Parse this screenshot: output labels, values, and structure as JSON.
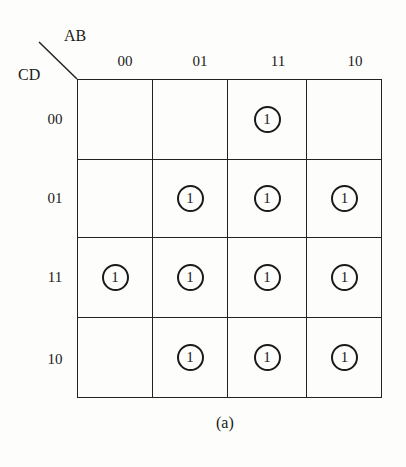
{
  "kmap": {
    "col_var": "AB",
    "row_var": "CD",
    "col_labels": [
      "00",
      "01",
      "11",
      "10"
    ],
    "row_labels": [
      "00",
      "01",
      "11",
      "10"
    ],
    "cells": [
      [
        "",
        "",
        "1",
        ""
      ],
      [
        "",
        "1",
        "1",
        "1"
      ],
      [
        "1",
        "1",
        "1",
        "1"
      ],
      [
        "",
        "1",
        "1",
        "1"
      ]
    ],
    "caption": "(a)"
  }
}
